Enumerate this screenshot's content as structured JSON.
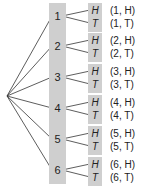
{
  "diagram": {
    "type": "tree",
    "root": "",
    "level1": [
      "1",
      "2",
      "3",
      "4",
      "5",
      "6"
    ],
    "level2": [
      "H",
      "T"
    ],
    "outcomes": [
      {
        "die": "1",
        "coin": "H",
        "label": "(1, H)"
      },
      {
        "die": "1",
        "coin": "T",
        "label": "(1, T)"
      },
      {
        "die": "2",
        "coin": "H",
        "label": "(2, H)"
      },
      {
        "die": "2",
        "coin": "T",
        "label": "(2, T)"
      },
      {
        "die": "3",
        "coin": "H",
        "label": "(3, H)"
      },
      {
        "die": "3",
        "coin": "T",
        "label": "(3, T)"
      },
      {
        "die": "4",
        "coin": "H",
        "label": "(4, H)"
      },
      {
        "die": "4",
        "coin": "T",
        "label": "(4, T)"
      },
      {
        "die": "5",
        "coin": "H",
        "label": "(5, H)"
      },
      {
        "die": "5",
        "coin": "T",
        "label": "(5, T)"
      },
      {
        "die": "6",
        "coin": "H",
        "label": "(6, H)"
      },
      {
        "die": "6",
        "coin": "T",
        "label": "(6, T)"
      }
    ],
    "colors": {
      "column": "#cfcfcf",
      "line": "#333333",
      "text": "#222222"
    }
  }
}
